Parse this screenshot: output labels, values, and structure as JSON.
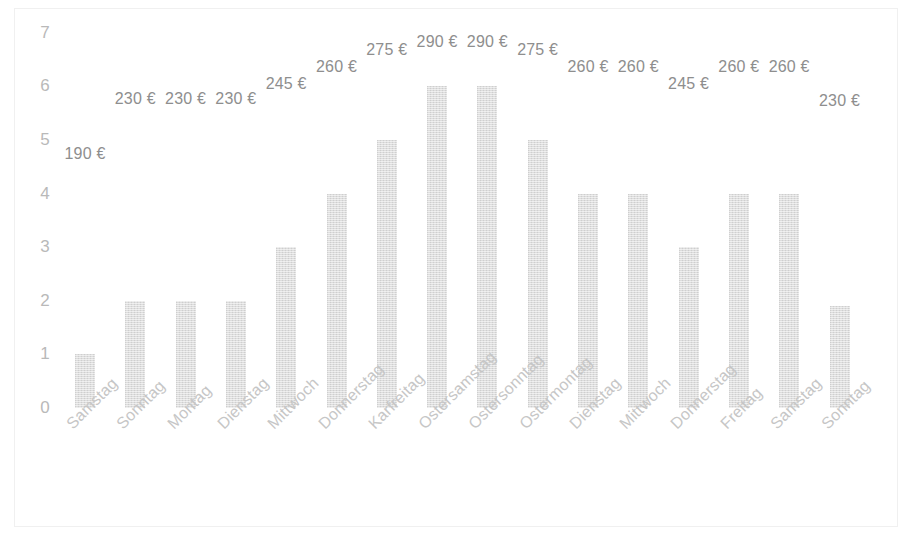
{
  "chart": {
    "type": "bar",
    "title": "",
    "background_color": "#ffffff",
    "bar_color": "#dddddd",
    "label_color": "#8e8e8e",
    "axis_label_color": "#c6c6c6"
  },
  "chart_data": {
    "type": "bar",
    "title": "",
    "subtitle": "",
    "xlabel": "",
    "ylabel": "",
    "ylim": [
      0,
      7
    ],
    "yticks": [
      0,
      1,
      2,
      3,
      4,
      5,
      6,
      7
    ],
    "ytick_labels": [
      "0",
      "1",
      "2",
      "3",
      "4",
      "5",
      "6",
      "7"
    ],
    "grid": false,
    "legend": null,
    "legend_position": "none",
    "categories": [
      "Samstag",
      "Sonntag",
      "Montag",
      "Dienstag",
      "Mittwoch",
      "Donnerstag",
      "Karfreitag",
      "Ostersamstag",
      "Ostersonntag",
      "Ostermontag",
      "Dienstag",
      "Mittwoch",
      "Donnerstag",
      "Freitag",
      "Samstag",
      "Sonntag"
    ],
    "values": [
      1,
      2,
      2,
      2,
      3,
      4,
      5,
      6,
      6,
      5,
      4,
      4,
      3,
      4,
      4,
      1.9
    ],
    "data_labels": [
      "190 €",
      "230 €",
      "230 €",
      "230 €",
      "245 €",
      "260 €",
      "275 €",
      "290 €",
      "290 €",
      "275 €",
      "260 €",
      "260 €",
      "245 €",
      "260 €",
      "260 €",
      "230 €"
    ],
    "label_values": [
      190,
      230,
      230,
      230,
      245,
      260,
      275,
      290,
      290,
      275,
      260,
      260,
      245,
      260,
      260,
      230
    ],
    "label_currency": "€",
    "label_y_px": [
      145,
      90,
      90,
      90,
      75,
      58,
      41,
      33,
      33,
      41,
      58,
      58,
      75,
      58,
      58,
      92
    ]
  }
}
